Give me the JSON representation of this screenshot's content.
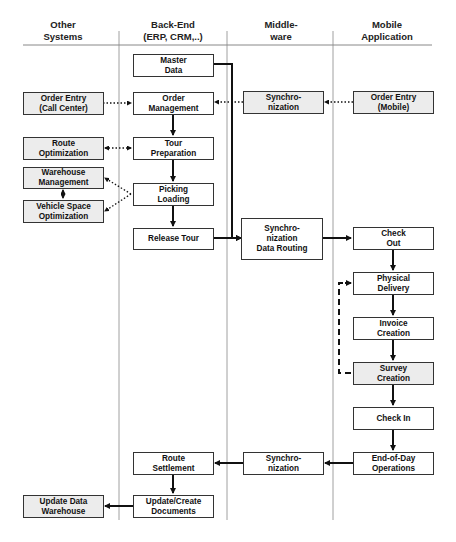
{
  "columns": [
    {
      "id": "other",
      "title": "Other\nSystems"
    },
    {
      "id": "backend",
      "title": "Back-End\n(ERP, CRM,..)"
    },
    {
      "id": "middleware",
      "title": "Middle-\nware"
    },
    {
      "id": "mobile",
      "title": "Mobile\nApplication"
    }
  ],
  "boxes": {
    "master_data": "Master\nData",
    "order_management": "Order\nManagement",
    "tour_preparation": "Tour\nPreparation",
    "picking_loading": "Picking\nLoading",
    "release_tour": "Release Tour",
    "route_settlement": "Route\nSettlement",
    "update_create_documents": "Update/Create\nDocuments",
    "order_entry_call_center": "Order Entry\n(Call Center)",
    "route_optimization": "Route\nOptimization",
    "warehouse_management": "Warehouse\nManagement",
    "vehicle_space_optimization": "Vehicle Space\nOptimization",
    "update_data_warehouse": "Update Data\nWarehouse",
    "sync_order": "Synchro-\nnization",
    "sync_data_routing": "Synchro-\nnization\nData Routing",
    "sync_end": "Synchro-\nnization",
    "order_entry_mobile": "Order Entry\n(Mobile)",
    "check_out": "Check\nOut",
    "physical_delivery": "Physical\nDelivery",
    "invoice_creation": "Invoice\nCreation",
    "survey_creation": "Survey\nCreation",
    "check_in": "Check In",
    "end_of_day": "End-of-Day\nOperations"
  },
  "colors": {
    "line": "#111111",
    "divider": "#888888",
    "box_border": "#333333",
    "gray_fill": "#ececec"
  },
  "caption": ""
}
